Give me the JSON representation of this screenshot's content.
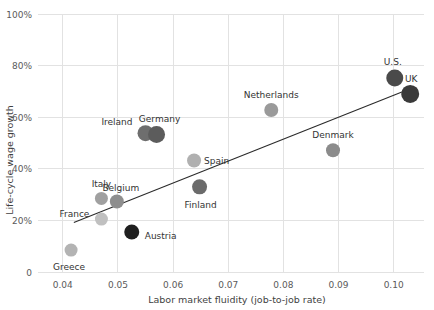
{
  "chart_data": {
    "type": "scatter",
    "title": "",
    "xlabel": "Labor market fluidity (job-to-job rate)",
    "ylabel": "Life-cycle wage growth",
    "xlim": [
      0.0355,
      0.1055
    ],
    "ylim": [
      0,
      1.0
    ],
    "xticks": [
      "0.04",
      "0.05",
      "0.06",
      "0.07",
      "0.08",
      "0.09",
      "0.10"
    ],
    "xtick_values": [
      0.04,
      0.05,
      0.06,
      0.07,
      0.08,
      0.09,
      0.1
    ],
    "yticks": [
      "0",
      "20%",
      "40%",
      "60%",
      "80%",
      "100%"
    ],
    "ytick_values": [
      0,
      0.2,
      0.4,
      0.6,
      0.8,
      1.0
    ],
    "grid": true,
    "legend": "none",
    "points": [
      {
        "name": "Greece",
        "x": 0.0415,
        "y": 0.085,
        "color": "#b3b3b3",
        "r": 6.5,
        "label_dx": -2,
        "label_dy": 20,
        "anchor": "middle"
      },
      {
        "name": "France",
        "x": 0.047,
        "y": 0.205,
        "color": "#c0c0c0",
        "r": 6.5,
        "label_dx": -12,
        "label_dy": -2,
        "anchor": "end"
      },
      {
        "name": "Italy",
        "x": 0.047,
        "y": 0.285,
        "color": "#a0a0a0",
        "r": 6.5,
        "label_dx": 0,
        "label_dy": -11,
        "anchor": "middle"
      },
      {
        "name": "Belgium",
        "x": 0.0498,
        "y": 0.273,
        "color": "#8e8e8e",
        "r": 7.0,
        "label_dx": 4,
        "label_dy": -11,
        "anchor": "middle"
      },
      {
        "name": "Austria",
        "x": 0.0525,
        "y": 0.155,
        "color": "#1f1f1f",
        "r": 7.5,
        "label_dx": 13,
        "label_dy": 7,
        "anchor": "start"
      },
      {
        "name": "Ireland",
        "x": 0.055,
        "y": 0.538,
        "color": "#6e6e6e",
        "r": 8.0,
        "label_dx": -13,
        "label_dy": -8,
        "anchor": "end"
      },
      {
        "name": "Germany",
        "x": 0.057,
        "y": 0.533,
        "color": "#5c5c5c",
        "r": 8.5,
        "label_dx": 3,
        "label_dy": -12,
        "anchor": "middle"
      },
      {
        "name": "Spain",
        "x": 0.0638,
        "y": 0.432,
        "color": "#b0b0b0",
        "r": 7.0,
        "label_dx": 10,
        "label_dy": 3,
        "anchor": "start"
      },
      {
        "name": "Finland",
        "x": 0.0648,
        "y": 0.33,
        "color": "#6b6b6b",
        "r": 7.5,
        "label_dx": 1,
        "label_dy": 21,
        "anchor": "middle"
      },
      {
        "name": "Netherlands",
        "x": 0.0778,
        "y": 0.628,
        "color": "#9a9a9a",
        "r": 7.0,
        "label_dx": 0,
        "label_dy": -12,
        "anchor": "middle"
      },
      {
        "name": "Denmark",
        "x": 0.089,
        "y": 0.472,
        "color": "#8b8b8b",
        "r": 7.0,
        "label_dx": 0,
        "label_dy": -12,
        "anchor": "middle"
      },
      {
        "name": "U.S.",
        "x": 0.1002,
        "y": 0.752,
        "color": "#4a4a4a",
        "r": 8.5,
        "label_dx": -2,
        "label_dy": -13,
        "anchor": "middle"
      },
      {
        "name": "UK",
        "x": 0.103,
        "y": 0.69,
        "color": "#3a3a3a",
        "r": 9.0,
        "label_dx": 1,
        "label_dy": -12,
        "anchor": "middle"
      }
    ],
    "trendline": {
      "x0": 0.042,
      "y0": 0.192,
      "x1": 0.1032,
      "y1": 0.712
    },
    "colors": {
      "gridline": "#e2e2e2",
      "trendline": "#2b2b2b",
      "text": "#3c3c3c"
    }
  }
}
